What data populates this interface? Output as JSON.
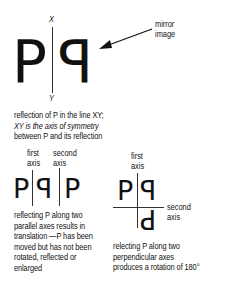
{
  "figure1": {
    "axis_top_label": "X",
    "axis_bottom_label": "Y",
    "letter_original": "P",
    "letter_reflected": "P",
    "pointer_label_line1": "mirror",
    "pointer_label_line2": "image",
    "caption": [
      "reflection of P in the line XY;",
      "XY is the axis of symmetry",
      "between P and its reflection"
    ]
  },
  "figure2": {
    "first_axis_label": [
      "first",
      "axis"
    ],
    "second_axis_label": [
      "second",
      "axis"
    ],
    "letters": [
      "P",
      "P",
      "P"
    ],
    "caption": [
      "reflecting P along two",
      "parallel axes results in",
      "translation —P has been",
      "moved but has not been",
      "rotated, reflected or",
      "enlarged"
    ]
  },
  "figure3": {
    "first_axis_label": [
      "first",
      "axis"
    ],
    "second_axis_label": [
      "second",
      "axis"
    ],
    "letters": [
      "P",
      "P",
      "P"
    ],
    "caption": [
      "relecting P along two",
      "perpendicular axes",
      "produces a rotation of 180°"
    ]
  }
}
